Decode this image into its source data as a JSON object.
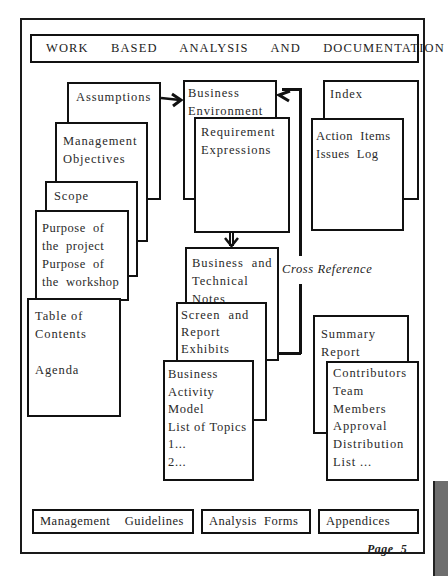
{
  "title": "WORK  BASED  ANALYSIS  AND  DOCUMENTATION",
  "left_stack": [
    {
      "id": "assumptions",
      "lines": "Assumptions"
    },
    {
      "id": "management-objectives",
      "lines": "Management\nObjectives"
    },
    {
      "id": "scope",
      "lines": "Scope"
    },
    {
      "id": "purpose",
      "lines": "Purpose  of\nthe  project\nPurpose  of\nthe  workshop"
    },
    {
      "id": "table-of-contents",
      "lines": "Table of\nContents\n\nAgenda"
    }
  ],
  "center_top": [
    {
      "id": "business-environment",
      "lines": "Business\nEnvironment"
    },
    {
      "id": "requirement-expressions",
      "lines": "Requirement\nExpressions"
    }
  ],
  "right_top": [
    {
      "id": "index",
      "lines": "Index"
    },
    {
      "id": "action-items",
      "lines": "Action  Items\nIssues  Log"
    }
  ],
  "center_bottom": [
    {
      "id": "business-technical-notes",
      "lines": "Business  and\nTechnical\nNotes"
    },
    {
      "id": "screen-report-exhibits",
      "lines": "Screen  and\nReport\nExhibits"
    },
    {
      "id": "business-activity-model",
      "lines": "Business\nActivity\nModel\nList of Topics\n1...\n2..."
    }
  ],
  "right_bottom": [
    {
      "id": "summary-report",
      "lines": "Summary\nReport"
    },
    {
      "id": "contributors",
      "lines": "Contributors\nTeam\nMembers\nApproval\nDistribution\nList ..."
    }
  ],
  "cross_reference_label": "Cross Reference",
  "bottom_boxes": {
    "management_guidelines": "Management    Guidelines",
    "analysis_forms": "Analysis  Forms",
    "appendices": "Appendices"
  },
  "page_label": "Page  5"
}
